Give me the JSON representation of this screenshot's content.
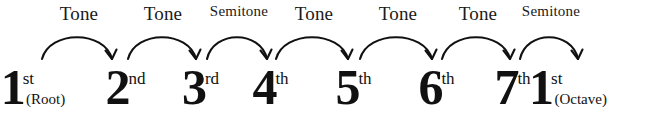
{
  "diagram": {
    "ink_color": "#111111",
    "background_color": "#ffffff",
    "degrees": [
      {
        "number": "1",
        "ordinal": "st",
        "note": "(Root)",
        "x": 38
      },
      {
        "number": "2",
        "ordinal": "nd",
        "note": "",
        "x": 126
      },
      {
        "number": "3",
        "ordinal": "rd",
        "note": "",
        "x": 201
      },
      {
        "number": "4",
        "ordinal": "th",
        "note": "",
        "x": 271
      },
      {
        "number": "5",
        "ordinal": "th",
        "note": "",
        "x": 354
      },
      {
        "number": "6",
        "ordinal": "th",
        "note": "",
        "x": 437
      },
      {
        "number": "7",
        "ordinal": "th",
        "note": "",
        "x": 513
      },
      {
        "number": "1",
        "ordinal": "st",
        "note": "(Octave)",
        "x": 573
      }
    ],
    "intervals": [
      {
        "label": "Tone",
        "size": "tone",
        "label_x": 79,
        "arc_x": 78,
        "arc_width": 76
      },
      {
        "label": "Tone",
        "size": "tone",
        "label_x": 163,
        "arc_x": 163,
        "arc_width": 74
      },
      {
        "label": "Semitone",
        "size": "semi",
        "label_x": 239,
        "arc_x": 238,
        "arc_width": 66
      },
      {
        "label": "Tone",
        "size": "tone",
        "label_x": 314,
        "arc_x": 313,
        "arc_width": 78
      },
      {
        "label": "Tone",
        "size": "tone",
        "label_x": 398,
        "arc_x": 397,
        "arc_width": 78
      },
      {
        "label": "Tone",
        "size": "tone",
        "label_x": 478,
        "arc_x": 477,
        "arc_width": 74
      },
      {
        "label": "Semitone",
        "size": "semi",
        "label_x": 551,
        "arc_x": 550,
        "arc_width": 64
      }
    ]
  }
}
